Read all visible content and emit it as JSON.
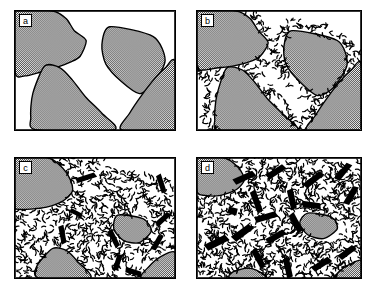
{
  "figure": {
    "width": 376,
    "height": 290,
    "background": "#ffffff",
    "line_color": "#000000",
    "grain_fill": "#a8a8a8",
    "lath_color": "#000000",
    "panel_count": 4,
    "layout": "2x2 grid"
  },
  "panels": [
    {
      "label": "a",
      "name": "panel-a",
      "stage": 1,
      "description": "Coarse stippled (grey) grains with clean sharp boundaries in a clear white matrix; no reaction products",
      "grain_count": 4,
      "dash_density": 0.0,
      "lath_count": 0,
      "grey_area_fraction": 0.42,
      "grains": [
        {
          "name": "grain-upper-left",
          "points": "0,0 38,0 52,8 60,20 72,30 66,46 56,52 40,58 26,62 10,66 0,62",
          "fill": "grain"
        },
        {
          "name": "grain-central-tablet",
          "points": "96,16 140,26 152,50 140,74 126,84 108,72 92,54 88,34",
          "fill": "grain"
        },
        {
          "name": "grain-lower-left",
          "points": "30,56 46,58 58,70 72,88 88,104 100,121 22,121 16,108 18,84",
          "fill": "grain"
        },
        {
          "name": "grain-right",
          "points": "162,52 162,121 108,121 116,104 128,86 142,68 152,58",
          "fill": "grain"
        }
      ]
    },
    {
      "label": "b",
      "name": "panel-b",
      "stage": 2,
      "description": "Incipient reaction: narrow rims of fine dark dashes nucleate along all grain boundaries; grain cores still large and grey",
      "grain_count": 4,
      "dash_density": 0.22,
      "lath_count": 0,
      "grey_area_fraction": 0.3,
      "grains": [
        {
          "name": "grain-upper-left",
          "points": "0,0 40,0 54,8 62,20 72,32 64,46 52,52 36,56 20,58 6,60 0,56",
          "fill": "grain"
        },
        {
          "name": "grain-central-tablet",
          "points": "96,20 142,30 152,54 138,78 122,86 104,72 90,54 88,36",
          "fill": "grain"
        },
        {
          "name": "grain-lower-left",
          "points": "30,58 46,60 58,72 72,90 88,106 100,122 24,122 18,110 20,86",
          "fill": "grain"
        },
        {
          "name": "grain-right",
          "points": "166,54 166,122 112,122 120,106 132,88 146,70 156,60",
          "fill": "grain"
        }
      ]
    },
    {
      "label": "c",
      "name": "panel-c",
      "stage": 3,
      "description": "Advanced reaction: dash-shaped reaction products fill most of the former matrix and invade grain margins; several solid black elongate laths have nucleated at varied orientations",
      "grain_count": 4,
      "dash_density": 0.55,
      "lath_count": 9,
      "grey_area_fraction": 0.17,
      "grains": [
        {
          "name": "grain-upper-left",
          "points": "0,0 34,0 48,10 56,22 58,34 48,44 32,50 16,52 2,52 0,48",
          "fill": "grain"
        },
        {
          "name": "grain-central-relic",
          "points": "104,58 130,62 138,74 126,86 110,84 100,72",
          "fill": "grain"
        },
        {
          "name": "grain-lower-left",
          "points": "38,92 52,94 64,106 76,122 24,122 22,110",
          "fill": "grain"
        },
        {
          "name": "grain-lower-right",
          "points": "162,96 162,122 128,122 136,110 148,100",
          "fill": "grain"
        }
      ],
      "laths": [
        {
          "cx": 72,
          "cy": 20,
          "len": 22,
          "w": 6,
          "angle": -16
        },
        {
          "cx": 148,
          "cy": 26,
          "len": 20,
          "w": 6,
          "angle": 74
        },
        {
          "cx": 150,
          "cy": 62,
          "len": 18,
          "w": 6,
          "angle": -40
        },
        {
          "cx": 48,
          "cy": 78,
          "len": 20,
          "w": 6,
          "angle": 82
        },
        {
          "cx": 100,
          "cy": 82,
          "len": 20,
          "w": 6,
          "angle": 66
        },
        {
          "cx": 144,
          "cy": 86,
          "len": 18,
          "w": 6,
          "angle": -58
        },
        {
          "cx": 104,
          "cy": 106,
          "len": 18,
          "w": 6,
          "angle": -70
        },
        {
          "cx": 120,
          "cy": 116,
          "len": 18,
          "w": 6,
          "angle": 20
        },
        {
          "cx": 62,
          "cy": 56,
          "len": 14,
          "w": 5,
          "angle": 30
        }
      ]
    },
    {
      "label": "d",
      "name": "panel-d",
      "stage": 4,
      "description": "Near-complete reaction: pervasive dash texture throughout, abundant large black laths in all orientations, only small grey relic grains survive at the corners",
      "grain_count": 4,
      "dash_density": 0.78,
      "lath_count": 18,
      "grey_area_fraction": 0.08,
      "grains": [
        {
          "name": "grain-upper-left-relic",
          "points": "0,0 28,0 42,10 48,22 40,32 24,38 8,38 0,34",
          "fill": "grain"
        },
        {
          "name": "grain-central-relic",
          "points": "112,56 136,60 142,72 128,82 112,78 104,66",
          "fill": "grain"
        },
        {
          "name": "grain-bottom-relic",
          "points": "50,112 60,114 70,122 34,122 36,116",
          "fill": "grain"
        },
        {
          "name": "grain-lower-right-relic",
          "points": "166,104 166,122 140,122 148,112",
          "fill": "grain"
        }
      ],
      "laths": [
        {
          "cx": 48,
          "cy": 20,
          "len": 24,
          "w": 7,
          "angle": -22
        },
        {
          "cx": 80,
          "cy": 14,
          "len": 22,
          "w": 7,
          "angle": -30
        },
        {
          "cx": 118,
          "cy": 22,
          "len": 24,
          "w": 7,
          "angle": -36
        },
        {
          "cx": 148,
          "cy": 14,
          "len": 22,
          "w": 7,
          "angle": -48
        },
        {
          "cx": 156,
          "cy": 38,
          "len": 22,
          "w": 7,
          "angle": -58
        },
        {
          "cx": 60,
          "cy": 44,
          "len": 24,
          "w": 7,
          "angle": 72
        },
        {
          "cx": 96,
          "cy": 42,
          "len": 22,
          "w": 7,
          "angle": 80
        },
        {
          "cx": 116,
          "cy": 48,
          "len": 20,
          "w": 7,
          "angle": 10
        },
        {
          "cx": 36,
          "cy": 54,
          "len": 10,
          "w": 8,
          "angle": 20
        },
        {
          "cx": 70,
          "cy": 60,
          "len": 24,
          "w": 7,
          "angle": -14
        },
        {
          "cx": 100,
          "cy": 66,
          "len": 22,
          "w": 7,
          "angle": 64
        },
        {
          "cx": 20,
          "cy": 86,
          "len": 26,
          "w": 8,
          "angle": -24
        },
        {
          "cx": 46,
          "cy": 76,
          "len": 24,
          "w": 8,
          "angle": -34
        },
        {
          "cx": 80,
          "cy": 80,
          "len": 22,
          "w": 7,
          "angle": -28
        },
        {
          "cx": 62,
          "cy": 102,
          "len": 22,
          "w": 7,
          "angle": 64
        },
        {
          "cx": 92,
          "cy": 112,
          "len": 22,
          "w": 7,
          "angle": 80
        },
        {
          "cx": 126,
          "cy": 108,
          "len": 22,
          "w": 7,
          "angle": -30
        },
        {
          "cx": 152,
          "cy": 96,
          "len": 20,
          "w": 7,
          "angle": -34
        }
      ]
    }
  ]
}
